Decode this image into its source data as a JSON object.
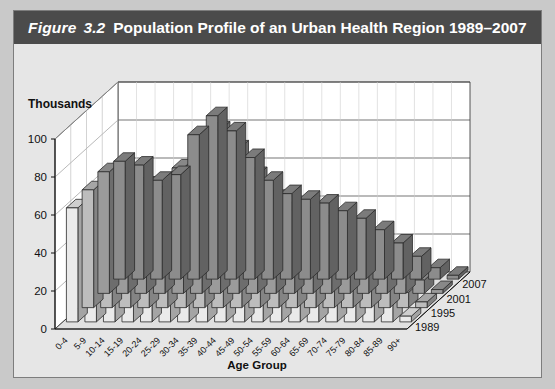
{
  "figure": {
    "label": "Figure",
    "number": "3.2",
    "title_rest": "Population Profile of an Urban Health Region 1989–2007"
  },
  "axes": {
    "y_unit_label": "Thousands",
    "y_ticks": [
      "100",
      "80",
      "60",
      "40",
      "20",
      "0"
    ],
    "x_axis_title": "Age Group"
  },
  "chart_data": {
    "type": "bar",
    "title": "Population Profile of an Urban Health Region 1989–2007",
    "subtitle": "Figure 3.2",
    "xlabel": "Age Group",
    "ylabel": "Thousands",
    "ylim": [
      0,
      100
    ],
    "yticks": [
      0,
      20,
      40,
      60,
      80,
      100
    ],
    "grid": true,
    "legend": "z-axis depth labels at right",
    "projection": "3d",
    "categories": [
      "0-4",
      "5-9",
      "10-14",
      "15-19",
      "20-24",
      "25-29",
      "30-34",
      "35-39",
      "40-44",
      "45-49",
      "50-54",
      "55-59",
      "60-64",
      "65-69",
      "70-74",
      "75-79",
      "80-84",
      "85-89",
      "90+"
    ],
    "series": [
      {
        "name": "1989",
        "values": [
          62,
          60,
          52,
          55,
          76,
          86,
          78,
          64,
          52,
          45,
          42,
          40,
          36,
          32,
          26,
          19,
          12,
          6,
          2
        ]
      },
      {
        "name": "1995",
        "values": [
          64,
          62,
          57,
          52,
          66,
          82,
          86,
          76,
          62,
          50,
          44,
          41,
          37,
          32,
          27,
          21,
          14,
          7,
          2
        ]
      },
      {
        "name": "2001",
        "values": [
          62,
          63,
          61,
          57,
          58,
          72,
          84,
          84,
          74,
          60,
          48,
          42,
          38,
          33,
          28,
          22,
          15,
          8,
          3
        ]
      },
      {
        "name": "2007",
        "values": [
          60,
          60,
          62,
          60,
          56,
          62,
          76,
          84,
          82,
          70,
          56,
          45,
          39,
          34,
          28,
          23,
          16,
          9,
          3
        ]
      }
    ],
    "z_labels": [
      "1989",
      "1995",
      "2001",
      "2007"
    ]
  },
  "colors": {
    "titlebar": "#4b4b4b",
    "page_background": "#c9c9c9",
    "panel_background": "#e6e6e6",
    "series_1989_front": "#8c8c8c",
    "series_1995_front": "#9b9b9b",
    "series_2001_front": "#bdbdbd",
    "series_2007_front": "#eaeaea",
    "wall": "#ffffff",
    "floor": "#e0e0e0"
  }
}
